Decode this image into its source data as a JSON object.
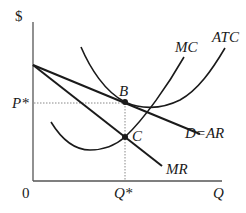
{
  "diagram": {
    "axes": {
      "y_label": "$",
      "x_label": "Q",
      "origin_label": "0",
      "price_tick": "P*",
      "quantity_tick": "Q*"
    },
    "curves": [
      {
        "id": "mc",
        "label": "MC",
        "shape": "U-shaped marginal cost"
      },
      {
        "id": "atc",
        "label": "ATC",
        "shape": "U-shaped average total cost"
      },
      {
        "id": "demand",
        "label": "D=AR",
        "shape": "downward sloping line"
      },
      {
        "id": "mr",
        "label": "MR",
        "shape": "downward sloping line, steeper than demand"
      }
    ],
    "points": [
      {
        "id": "B",
        "label": "B",
        "meaning": "demand/ATC at Q*, price P*"
      },
      {
        "id": "C",
        "label": "C",
        "meaning": "MC = MR intersection at Q*"
      }
    ],
    "colors": {
      "ink": "#1a1a1a",
      "axis": "#555555",
      "guide": "#888888",
      "background": "#ffffff"
    }
  }
}
